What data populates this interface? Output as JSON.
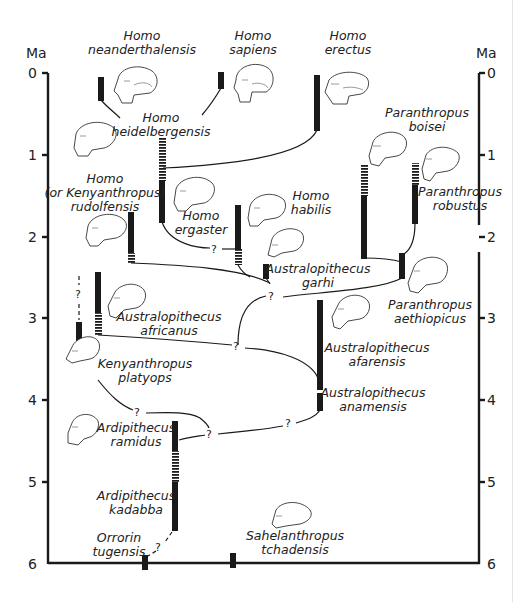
{
  "axis": {
    "unit_left": "Ma",
    "unit_right": "Ma",
    "ticks": [
      "0",
      "1",
      "2",
      "3",
      "4",
      "5",
      "6"
    ]
  },
  "taxa": {
    "neanderthalensis": [
      "Homo",
      "neanderthalensis"
    ],
    "sapiens": [
      "Homo",
      "sapiens"
    ],
    "erectus": [
      "Homo",
      "erectus"
    ],
    "heidelbergensis": [
      "Homo",
      "heidelbergensis"
    ],
    "rudolfensis": [
      "Homo",
      "(or Kenyanthropus)",
      "rudolfensis"
    ],
    "ergaster": [
      "Homo",
      "ergaster"
    ],
    "habilis": [
      "Homo",
      "habilis"
    ],
    "garhi": [
      "Australopithecus",
      "garhi"
    ],
    "boisei": [
      "Paranthropus",
      "boisei"
    ],
    "robustus": [
      "Paranthropus",
      "robustus"
    ],
    "aethiopicus": [
      "Paranthropus",
      "aethiopicus"
    ],
    "africanus": [
      "Australopithecus",
      "africanus"
    ],
    "platyops": [
      "Kenyanthropus",
      "platyops"
    ],
    "afarensis": [
      "Australopithecus",
      "afarensis"
    ],
    "anamensis": [
      "Australopithecus",
      "anamensis"
    ],
    "ramidus": [
      "Ardipithecus",
      "ramidus"
    ],
    "kadabba": [
      "Ardipithecus",
      "kadabba"
    ],
    "tugenensis": [
      "Orrorin",
      "tugensis"
    ],
    "tchadensis": [
      "Sahelanthropus",
      "tchadensis"
    ]
  },
  "uncertain_mark": "?"
}
